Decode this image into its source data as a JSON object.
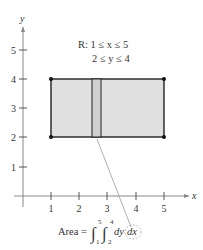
{
  "diagram": {
    "axes": {
      "x_label": "x",
      "y_label": "y",
      "x_ticks": [
        "1",
        "2",
        "3",
        "4",
        "5"
      ],
      "y_ticks": [
        "1",
        "2",
        "3",
        "4",
        "5"
      ]
    },
    "region": {
      "name": "R",
      "line1": "R: 1 ≤ x ≤ 5",
      "line2": "2 ≤ y ≤ 4",
      "x_range": [
        1,
        5
      ],
      "y_range": [
        2,
        4
      ],
      "fill_color": "#e0e0e0",
      "strip_color": "#cfcfcf",
      "edge_color": "#222222"
    },
    "formula": {
      "lhs": "Area =",
      "outer_upper": "5",
      "outer_lower": "1",
      "inner_upper": "4",
      "inner_lower": "2",
      "integrand": "dy",
      "differential": "dx"
    }
  }
}
